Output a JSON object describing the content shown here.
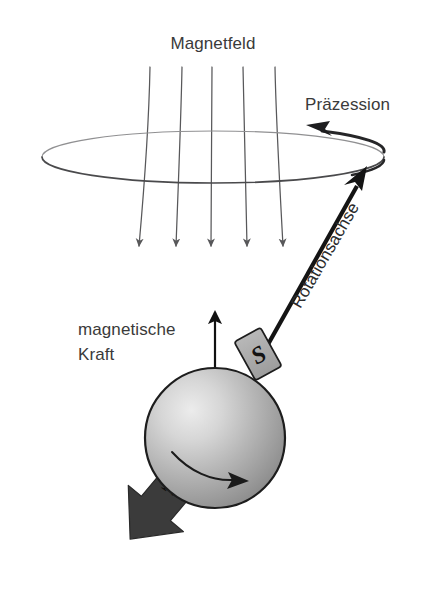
{
  "diagram": {
    "background_color": "#ffffff",
    "labels": {
      "magnetic_field": "Magnetfeld",
      "precession": "Präzession",
      "rotation_axis": "Rotationsachse",
      "magnetic_force_line1": "magnetische",
      "magnetic_force_line2": "Kraft",
      "pole_south": "S",
      "pole_north": "N"
    },
    "colors": {
      "text": "#3a3a3a",
      "text_dark": "#2b2b2b",
      "field_line": "#58585a",
      "ellipse_far": "#8a8a8c",
      "ellipse_near": "#3c3c3e",
      "axis_arrow": "#141414",
      "force_arrow": "#111111",
      "sphere_light": "#e6e6e6",
      "sphere_mid": "#b4b4b4",
      "sphere_dark": "#8c8c8c",
      "sphere_outline": "#1d1d1d",
      "pole_box_fill": "#a9a9a9",
      "pole_box_stroke": "#1d1d1d",
      "north_arrow_fill": "#3b3b3b",
      "spin_arrow": "#1b1b1b"
    },
    "field_lines": {
      "count": 5,
      "top_y": 67,
      "tip_y": 252,
      "tops_x": [
        150,
        182,
        212,
        243,
        275
      ],
      "tips_x": [
        139,
        176,
        211,
        247,
        283
      ],
      "direction": "downward"
    },
    "precession_ellipse": {
      "center_x": 213,
      "center_y": 157,
      "radius_x": 171,
      "radius_y": 26,
      "arrow_direction": "counterclockwise-left"
    },
    "sphere": {
      "center_x": 215,
      "center_y": 438,
      "radius": 70,
      "spin_direction": "rightward"
    },
    "rotation_axis": {
      "from_x": 266,
      "from_y": 348,
      "to_x": 367,
      "to_y": 168,
      "angle_deg": -60
    },
    "magnetic_force_arrow": {
      "x": 215,
      "from_y": 372,
      "to_y": 308,
      "direction": "upward"
    },
    "north_arrow": {
      "from_x": 205,
      "from_y": 480,
      "to_x": 116,
      "to_y": 557,
      "direction": "down-left"
    }
  }
}
